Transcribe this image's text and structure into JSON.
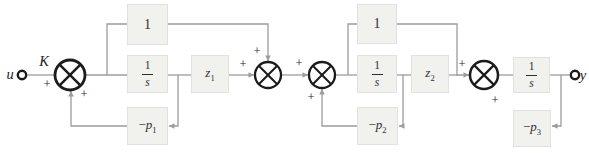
{
  "diagram": {
    "theme": {
      "background": "#ffffff",
      "wire": "#9c9c9c",
      "node": "#1b1b1b",
      "block_fill": "#f1f1ee",
      "block_border": "#e1e1dd",
      "text": "#1d1d1d"
    },
    "terminals": [
      {
        "name": "input-terminal",
        "x": 22,
        "y": 75,
        "r": 4.2
      },
      {
        "name": "output-terminal",
        "x": 575,
        "y": 75,
        "r": 4.2
      }
    ],
    "junctions": [
      {
        "name": "summing-junction-1",
        "x": 70,
        "y": 75,
        "r": 15,
        "sw": 2.8
      },
      {
        "name": "summing-junction-2",
        "x": 268,
        "y": 75,
        "r": 13,
        "sw": 2.3
      },
      {
        "name": "summing-junction-3",
        "x": 322,
        "y": 75,
        "r": 13,
        "sw": 2.3
      },
      {
        "name": "summing-junction-4",
        "x": 484,
        "y": 75,
        "r": 14,
        "sw": 2.5
      }
    ],
    "blocks": [
      {
        "name": "block-one-1",
        "x": 127,
        "y": 4,
        "w": 41,
        "h": 41,
        "label": {
          "t": "txt",
          "v": "1"
        }
      },
      {
        "name": "block-integrator-1",
        "x": 127,
        "y": 55,
        "w": 41,
        "h": 38,
        "label": {
          "t": "frac",
          "n": "1",
          "d": "s"
        }
      },
      {
        "name": "block-neg-p1",
        "x": 127,
        "y": 107,
        "w": 41,
        "h": 38,
        "label": {
          "t": "sub",
          "pre": "−",
          "b": "p",
          "s": "1"
        }
      },
      {
        "name": "block-z1",
        "x": 191,
        "y": 55,
        "w": 38,
        "h": 38,
        "label": {
          "t": "sub",
          "b": "z",
          "s": "1"
        }
      },
      {
        "name": "block-one-2",
        "x": 357,
        "y": 4,
        "w": 40,
        "h": 40,
        "label": {
          "t": "txt",
          "v": "1"
        }
      },
      {
        "name": "block-integrator-2",
        "x": 357,
        "y": 55,
        "w": 40,
        "h": 38,
        "label": {
          "t": "frac",
          "n": "1",
          "d": "s"
        }
      },
      {
        "name": "block-neg-p2",
        "x": 357,
        "y": 107,
        "w": 41,
        "h": 38,
        "label": {
          "t": "sub",
          "pre": "−",
          "b": "p",
          "s": "2"
        }
      },
      {
        "name": "block-z2",
        "x": 411,
        "y": 55,
        "w": 38,
        "h": 38,
        "label": {
          "t": "sub",
          "b": "z",
          "s": "2"
        }
      },
      {
        "name": "block-integrator-3",
        "x": 513,
        "y": 57,
        "w": 37,
        "h": 36,
        "label": {
          "t": "frac",
          "n": "1",
          "d": "s"
        }
      },
      {
        "name": "block-neg-p3",
        "x": 513,
        "y": 110,
        "w": 38,
        "h": 37,
        "label": {
          "t": "sub",
          "pre": "−",
          "b": "p",
          "s": "3"
        }
      }
    ],
    "wires": [
      {
        "name": "wire-input",
        "pts": [
          [
            27.5,
            75
          ],
          [
            55,
            75
          ]
        ]
      },
      {
        "name": "wire-j1-out",
        "pts": [
          [
            85,
            75
          ],
          [
            127,
            75
          ]
        ]
      },
      {
        "name": "wire-branch-1",
        "pts": [
          [
            107,
            75
          ],
          [
            107,
            24
          ],
          [
            127,
            24
          ]
        ]
      },
      {
        "name": "wire-one1-to-j2",
        "pts": [
          [
            168,
            24
          ],
          [
            268,
            24
          ],
          [
            268,
            61
          ]
        ],
        "arrow": true
      },
      {
        "name": "wire-int1-out",
        "pts": [
          [
            168,
            75
          ],
          [
            191,
            75
          ]
        ]
      },
      {
        "name": "wire-tap-1",
        "pts": [
          [
            178,
            75
          ],
          [
            178,
            126
          ],
          [
            169,
            126
          ]
        ],
        "arrow": true
      },
      {
        "name": "wire-p1-feedback",
        "pts": [
          [
            127,
            126
          ],
          [
            71,
            126
          ],
          [
            71,
            91
          ]
        ],
        "arrow": true
      },
      {
        "name": "wire-z1-to-j2",
        "pts": [
          [
            229,
            75
          ],
          [
            254,
            75
          ]
        ],
        "arrow": true
      },
      {
        "name": "wire-j2-to-j3",
        "pts": [
          [
            281,
            75
          ],
          [
            308,
            75
          ]
        ],
        "arrow": true
      },
      {
        "name": "wire-j3-out",
        "pts": [
          [
            335,
            75
          ],
          [
            357,
            75
          ]
        ]
      },
      {
        "name": "wire-branch-2",
        "pts": [
          [
            348,
            75
          ],
          [
            348,
            24
          ],
          [
            357,
            24
          ]
        ]
      },
      {
        "name": "wire-one2-to-j4",
        "pts": [
          [
            397,
            24
          ],
          [
            457,
            24
          ],
          [
            457,
            75
          ],
          [
            469,
            75
          ]
        ],
        "arrow": true
      },
      {
        "name": "wire-int2-out",
        "pts": [
          [
            397,
            75
          ],
          [
            411,
            75
          ]
        ]
      },
      {
        "name": "wire-tap-2",
        "pts": [
          [
            403,
            75
          ],
          [
            403,
            126
          ],
          [
            399,
            126
          ]
        ],
        "arrow": true
      },
      {
        "name": "wire-p2-feedback",
        "pts": [
          [
            357,
            126
          ],
          [
            322,
            126
          ],
          [
            322,
            89
          ]
        ],
        "arrow": true
      },
      {
        "name": "wire-z2-out",
        "pts": [
          [
            449,
            75
          ],
          [
            458,
            75
          ]
        ]
      },
      {
        "name": "wire-j4-out",
        "pts": [
          [
            498,
            75
          ],
          [
            513,
            75
          ]
        ]
      },
      {
        "name": "wire-int3-out",
        "pts": [
          [
            550,
            75
          ],
          [
            569.5,
            75
          ]
        ]
      },
      {
        "name": "wire-tap-3",
        "pts": [
          [
            561,
            75
          ],
          [
            561,
            126
          ],
          [
            552,
            126
          ]
        ],
        "arrow": true
      }
    ],
    "labels": [
      {
        "name": "label-u",
        "text": "u",
        "x": 10,
        "y": 74,
        "cls": "sig"
      },
      {
        "name": "label-K",
        "text": "K",
        "x": 44,
        "y": 61,
        "cls": "sig"
      },
      {
        "name": "label-y",
        "text": "y",
        "x": 583,
        "y": 75,
        "cls": "sig"
      },
      {
        "name": "plus-j1-input",
        "text": "+",
        "x": 47,
        "y": 84,
        "cls": "plus"
      },
      {
        "name": "plus-j1-feedback",
        "text": "+",
        "x": 84,
        "y": 94,
        "cls": "plus"
      },
      {
        "name": "plus-j2-input",
        "text": "+",
        "x": 243,
        "y": 64,
        "cls": "plus"
      },
      {
        "name": "plus-j2-top",
        "text": "+",
        "x": 257,
        "y": 51,
        "cls": "plus"
      },
      {
        "name": "plus-j3-input",
        "text": "+",
        "x": 299,
        "y": 63,
        "cls": "plus"
      },
      {
        "name": "plus-j3-feedback",
        "text": "+",
        "x": 311,
        "y": 97,
        "cls": "plus"
      },
      {
        "name": "plus-j4-input",
        "text": "+",
        "x": 462,
        "y": 64,
        "cls": "plus"
      },
      {
        "name": "plus-j4-feedback",
        "text": "+",
        "x": 495,
        "y": 100,
        "cls": "plus"
      }
    ]
  }
}
